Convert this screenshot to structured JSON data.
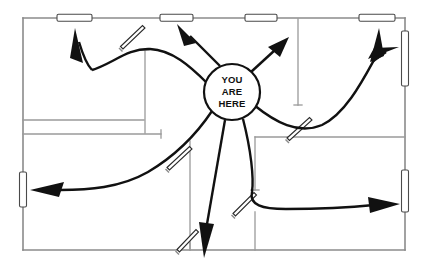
{
  "map": {
    "title": "Evacuation Floor Plan",
    "you_are_here": {
      "line1": "YOU",
      "line2": "ARE",
      "line3": "HERE",
      "center_x": 232,
      "center_y": 92,
      "radius": 28
    },
    "bounds": {
      "left": 23,
      "top": 18,
      "right": 405,
      "bottom": 250
    }
  },
  "outer_walls": [
    {
      "name": "top-exterior-wall",
      "x1": 23,
      "y1": 18,
      "x2": 405,
      "y2": 18
    },
    {
      "name": "right-exterior-wall",
      "x1": 405,
      "y1": 18,
      "x2": 405,
      "y2": 250
    },
    {
      "name": "bottom-exterior-wall",
      "x1": 405,
      "y1": 250,
      "x2": 23,
      "y2": 250
    },
    {
      "name": "left-exterior-wall",
      "x1": 23,
      "y1": 250,
      "x2": 23,
      "y2": 18
    }
  ],
  "interior_walls": [
    {
      "name": "interior-wall-upper-left-vertical",
      "x1": 145,
      "y1": 50,
      "x2": 145,
      "y2": 133
    },
    {
      "name": "interior-wall-upper-right-vertical",
      "x1": 298,
      "y1": 19,
      "x2": 298,
      "y2": 105
    },
    {
      "name": "interior-wall-mid-left-horizontal",
      "x1": 23,
      "y1": 134,
      "x2": 161,
      "y2": 134
    },
    {
      "name": "interior-wall-upper-left-room-bottom",
      "x1": 23,
      "y1": 120,
      "x2": 144,
      "y2": 120
    },
    {
      "name": "interior-wall-lower-center-vertical",
      "x1": 190,
      "y1": 141,
      "x2": 190,
      "y2": 250
    },
    {
      "name": "interior-wall-lower-right-horizontal",
      "x1": 255,
      "y1": 137,
      "x2": 405,
      "y2": 137
    },
    {
      "name": "interior-wall-lower-right-vertical-upper",
      "x1": 255,
      "y1": 137,
      "x2": 255,
      "y2": 190
    },
    {
      "name": "interior-wall-lower-right-vertical-lower",
      "x1": 255,
      "y1": 212,
      "x2": 255,
      "y2": 250
    }
  ],
  "windows": [
    {
      "name": "window-top-1",
      "orientation": "horizontal",
      "x": 57,
      "y": 14.2,
      "w": 35,
      "h": 7
    },
    {
      "name": "window-top-2",
      "orientation": "horizontal",
      "x": 160,
      "y": 14.2,
      "w": 33,
      "h": 7
    },
    {
      "name": "window-top-3",
      "orientation": "horizontal",
      "x": 245,
      "y": 14.2,
      "w": 32,
      "h": 7
    },
    {
      "name": "window-top-4",
      "orientation": "horizontal",
      "x": 359,
      "y": 14.2,
      "w": 36,
      "h": 7
    },
    {
      "name": "window-right-upper",
      "orientation": "vertical",
      "x": 401.5,
      "y": 31,
      "w": 7,
      "h": 55
    },
    {
      "name": "window-right-lower",
      "orientation": "vertical",
      "x": 401.5,
      "y": 170,
      "w": 7,
      "h": 42
    },
    {
      "name": "window-left-lower",
      "orientation": "vertical",
      "x": 19.5,
      "y": 172,
      "w": 7,
      "h": 35
    }
  ],
  "doors": [
    {
      "name": "door-top-left-room",
      "x1": 120,
      "y1": 45,
      "x2": 143,
      "y2": 25
    },
    {
      "name": "door-top-right-room",
      "x1": 287,
      "y1": 137,
      "x2": 311,
      "y2": 118
    },
    {
      "name": "door-mid-left-room",
      "x1": 168,
      "y1": 166,
      "x2": 192,
      "y2": 145
    },
    {
      "name": "door-bottom-center-room",
      "x1": 178,
      "y1": 248,
      "x2": 198,
      "y2": 228
    },
    {
      "name": "door-bottom-right-room",
      "x1": 234,
      "y1": 212,
      "x2": 256,
      "y2": 192
    }
  ],
  "routes": [
    {
      "name": "route-northwest-to-top-window-1",
      "target": "window-top-1"
    },
    {
      "name": "route-north-to-top-window-2",
      "target": "window-top-2"
    },
    {
      "name": "route-northeast-to-top-window-3",
      "target": "window-top-3"
    },
    {
      "name": "route-east-to-top-window-4",
      "target": "window-top-4"
    },
    {
      "name": "route-east-to-right-upper-window",
      "target": "window-right-upper"
    },
    {
      "name": "route-west-to-left-window",
      "target": "window-left-lower"
    },
    {
      "name": "route-southeast-to-right-lower-window",
      "target": "window-right-lower"
    },
    {
      "name": "route-south-to-bottom-exit",
      "target": "bottom-exit"
    }
  ]
}
